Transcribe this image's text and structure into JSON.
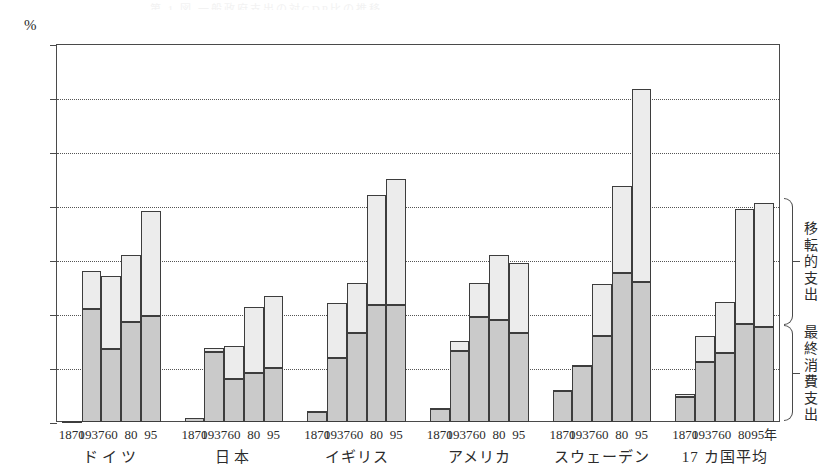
{
  "title_faint": "第 1 図  一般政府支出の対GDP比の推移",
  "axis": {
    "unit_label": "%",
    "y_ticks": [
      0,
      10,
      20,
      30,
      40,
      50,
      60,
      70
    ],
    "y_min": 0,
    "y_max": 70,
    "x_unit_suffix": "年"
  },
  "legend": {
    "transfer_label": "移転的支出",
    "consumption_label": "最終消費支出"
  },
  "chart_data": {
    "type": "bar",
    "title": "一般政府支出の対GDP比",
    "xlabel": "",
    "ylabel": "%",
    "ylim": [
      0,
      70
    ],
    "grid": true,
    "stacked": true,
    "legend_position": "right",
    "categories": [
      "ドイツ 1870",
      "ドイツ 1937",
      "ドイツ 60",
      "ドイツ 80",
      "ドイツ 95",
      "日本 1870",
      "日本 1937",
      "日本 60",
      "日本 80",
      "日本 95",
      "イギリス 1870",
      "イギリス 1937",
      "イギリス 60",
      "イギリス 80",
      "イギリス 95",
      "アメリカ 1870",
      "アメリカ 1937",
      "アメリカ 60",
      "アメリカ 80",
      "アメリカ 95",
      "スウェーデン 1870",
      "スウェーデン 1937",
      "スウェーデン 60",
      "スウェーデン 80",
      "スウェーデン 95",
      "17カ国平均 1870",
      "17カ国平均 1937",
      "17カ国平均 60",
      "17カ国平均 80",
      "17カ国平均 95"
    ],
    "series": [
      {
        "name": "最終消費支出",
        "color": "#cacaca",
        "values": [
          0.2,
          21.0,
          13.5,
          18.5,
          19.7,
          0.7,
          13.0,
          8.0,
          9.0,
          10.0,
          1.9,
          11.8,
          16.5,
          21.7,
          21.7,
          2.4,
          13.2,
          19.5,
          18.8,
          16.5,
          5.7,
          10.4,
          16.0,
          27.5,
          26.0,
          4.6,
          11.2,
          12.7,
          18.2,
          17.5
        ]
      },
      {
        "name": "移転的支出",
        "color": "#ececec",
        "values": [
          0.0,
          7.0,
          13.5,
          12.5,
          19.3,
          0.1,
          0.7,
          6.0,
          12.3,
          13.4,
          0.2,
          10.2,
          9.3,
          20.3,
          23.3,
          0.2,
          1.8,
          6.3,
          12.2,
          13.0,
          0.3,
          0.2,
          9.5,
          16.2,
          35.6,
          0.5,
          4.8,
          9.6,
          21.3,
          23.0
        ]
      }
    ],
    "totals": [
      0.2,
      28.0,
      27.0,
      31.0,
      39.0,
      0.8,
      13.7,
      14.0,
      21.3,
      23.4,
      2.1,
      22.0,
      25.8,
      42.0,
      45.0,
      2.6,
      15.0,
      25.8,
      31.0,
      29.5,
      6.0,
      10.6,
      25.5,
      43.7,
      61.6,
      5.1,
      16.0,
      22.3,
      39.5,
      40.5
    ]
  },
  "groups": [
    {
      "country": "ドイツ",
      "years": [
        "1870",
        "1937",
        "60",
        "80",
        "95"
      ],
      "bottom": [
        0.2,
        21.0,
        13.5,
        18.5,
        19.7
      ],
      "total": [
        0.2,
        28.0,
        27.0,
        31.0,
        39.0
      ]
    },
    {
      "country": "日本",
      "years": [
        "1870",
        "1937",
        "60",
        "80",
        "95"
      ],
      "bottom": [
        0.7,
        13.0,
        8.0,
        9.0,
        10.0
      ],
      "total": [
        0.8,
        13.7,
        14.0,
        21.3,
        23.4
      ]
    },
    {
      "country": "イギリス",
      "years": [
        "1870",
        "1937",
        "60",
        "80",
        "95"
      ],
      "bottom": [
        1.9,
        11.8,
        16.5,
        21.7,
        21.7
      ],
      "total": [
        2.1,
        22.0,
        25.8,
        42.0,
        45.0
      ]
    },
    {
      "country": "アメリカ",
      "years": [
        "1870",
        "1937",
        "60",
        "80",
        "95"
      ],
      "bottom": [
        2.4,
        13.2,
        19.5,
        18.8,
        16.5
      ],
      "total": [
        2.6,
        15.0,
        25.8,
        31.0,
        29.5
      ]
    },
    {
      "country": "スウェーデン",
      "years": [
        "1870",
        "1937",
        "60",
        "80",
        "95"
      ],
      "bottom": [
        5.7,
        10.4,
        16.0,
        27.5,
        26.0
      ],
      "total": [
        6.0,
        10.6,
        25.5,
        43.7,
        61.6
      ]
    },
    {
      "country": "17 カ国平均",
      "years": [
        "1870",
        "1937",
        "60",
        "80",
        "95年"
      ],
      "bottom": [
        4.6,
        11.2,
        12.7,
        18.2,
        17.5
      ],
      "total": [
        5.1,
        16.0,
        22.3,
        39.5,
        40.5
      ]
    }
  ],
  "colors": {
    "bar_bottom": "#cacaca",
    "bar_top": "#ececec",
    "bar_border": "#3d3d3d",
    "axis": "#4a4a4a",
    "grid": "#555555",
    "text": "#2b2b2b"
  }
}
